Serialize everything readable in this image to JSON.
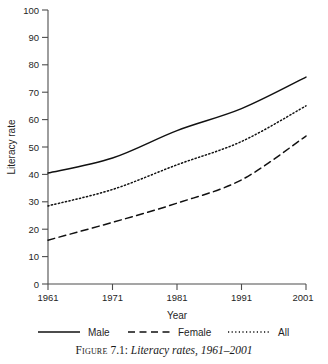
{
  "chart_data": {
    "type": "line",
    "title": "",
    "xlabel": "Year",
    "ylabel": "Literacy rate",
    "x": [
      1961,
      1971,
      1981,
      1991,
      2001
    ],
    "xtick_labels": [
      "1961",
      "1971",
      "1981",
      "1991",
      "2001"
    ],
    "ytick_labels": [
      "0",
      "10",
      "20",
      "30",
      "40",
      "50",
      "60",
      "70",
      "80",
      "90",
      "100"
    ],
    "ytick_values": [
      0,
      10,
      20,
      30,
      40,
      50,
      60,
      70,
      80,
      90,
      100
    ],
    "xlim": [
      1961,
      2001
    ],
    "ylim": [
      0,
      100
    ],
    "grid": false,
    "legend_position": "below-axes",
    "series": [
      {
        "name": "Male",
        "style": "solid",
        "color": "#111111",
        "values": [
          40.5,
          46.0,
          56.0,
          64.0,
          75.5
        ]
      },
      {
        "name": "Female",
        "style": "dashed",
        "color": "#111111",
        "values": [
          16.0,
          22.5,
          29.5,
          38.0,
          54.0
        ]
      },
      {
        "name": "All",
        "style": "dotted",
        "color": "#111111",
        "values": [
          28.5,
          34.5,
          43.5,
          52.0,
          65.0
        ]
      }
    ]
  },
  "legend": {
    "items": [
      {
        "label": "Male",
        "style": "solid"
      },
      {
        "label": "Female",
        "style": "dashed"
      },
      {
        "label": "All",
        "style": "dotted"
      }
    ]
  },
  "caption": {
    "figure_word": "Figure",
    "number": " 7.1: ",
    "title": "Literacy rates, 1961–2001"
  }
}
